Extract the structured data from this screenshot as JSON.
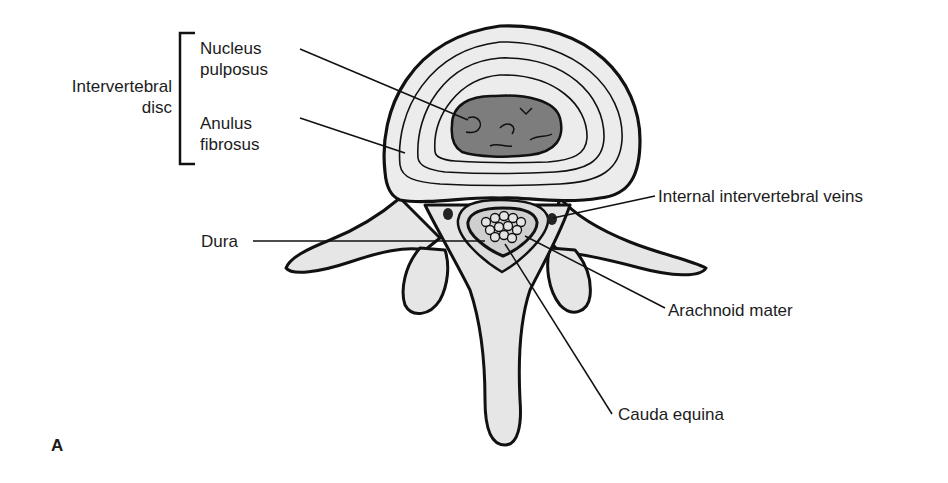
{
  "figure": {
    "panel_letter": "A",
    "group_label": {
      "line1": "Intervertebral",
      "line2": "disc"
    },
    "labels": {
      "nucleus_line1": "Nucleus",
      "nucleus_line2": "pulposus",
      "anulus_line1": "Anulus",
      "anulus_line2": "fibrosus",
      "dura": "Dura",
      "veins": "Internal intervertebral veins",
      "arachnoid": "Arachnoid mater",
      "cauda": "Cauda equina"
    },
    "colors": {
      "ink": "#111111",
      "bone_fill": "#e6e6e6",
      "disc_fill": "#ececec",
      "nucleus_fill": "#7d7d7d",
      "background": "#ffffff"
    }
  }
}
